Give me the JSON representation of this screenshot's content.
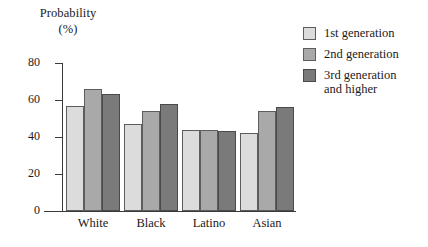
{
  "chart_data": {
    "type": "bar",
    "title": "",
    "ylabel_line1": "Probability",
    "ylabel_line2": "(%)",
    "xlabel": "",
    "categories": [
      "White",
      "Black",
      "Latino",
      "Asian"
    ],
    "series": [
      {
        "name": "1st generation",
        "color": "#dcdcdc",
        "values": [
          57,
          47,
          44,
          42
        ]
      },
      {
        "name": "2nd generation",
        "color": "#a9a9a9",
        "values": [
          66,
          54,
          44,
          54
        ]
      },
      {
        "name": "3rd generation and higher",
        "color": "#7a7a7a",
        "values": [
          63,
          58,
          43,
          56
        ]
      }
    ],
    "ylim": [
      0,
      80
    ],
    "yticks": [
      0,
      20,
      40,
      60,
      80
    ],
    "ytick_labels": [
      "0",
      "20",
      "40",
      "60",
      "80"
    ],
    "grid": false,
    "legend_position": "right"
  },
  "legend": {
    "items": [
      {
        "label": "1st generation"
      },
      {
        "label": "2nd generation"
      },
      {
        "label": "3rd generation\nand higher"
      }
    ]
  }
}
